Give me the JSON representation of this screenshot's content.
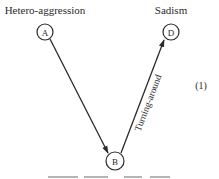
{
  "diagram": {
    "type": "directed-graph",
    "equation_number": "(1)",
    "nodes": [
      {
        "id": "A",
        "label": "A",
        "title": "Hetero-aggression",
        "cx": 45,
        "cy": 32,
        "r": 8
      },
      {
        "id": "D",
        "label": "D",
        "title": "Sadism",
        "cx": 171,
        "cy": 32,
        "r": 8
      },
      {
        "id": "B",
        "label": "B",
        "title": "",
        "cx": 115,
        "cy": 161,
        "r": 9
      }
    ],
    "edges": [
      {
        "from": "A",
        "to": "B",
        "label": ""
      },
      {
        "from": "B",
        "to": "D",
        "label": "Turning-around"
      }
    ]
  },
  "colors": {
    "ink": "#2a2a2a",
    "background": "#ffffff"
  }
}
